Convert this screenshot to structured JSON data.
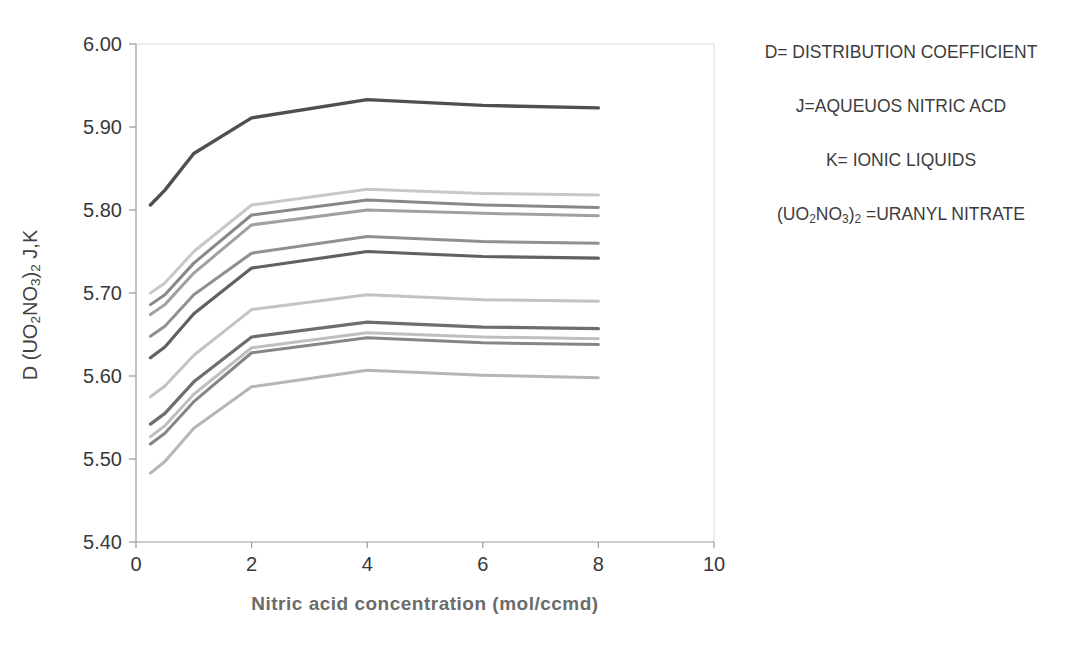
{
  "chart_data": {
    "type": "line",
    "title": "",
    "xlabel": "Nitric acid concentration (mol/ccmd)",
    "ylabel_plain": "D (UO2NO3)2 J,K",
    "ylabel_parts": [
      {
        "t": "D (UO"
      },
      {
        "t": "2",
        "sub": true
      },
      {
        "t": "NO"
      },
      {
        "t": "3",
        "sub": true
      },
      {
        "t": ")"
      },
      {
        "t": "2",
        "sub": true
      },
      {
        "t": " J,K"
      }
    ],
    "xlim": [
      0,
      10
    ],
    "ylim": [
      5.4,
      6.0
    ],
    "grid": false,
    "legend_position": "none",
    "x_tick_labels": [
      "0",
      "2",
      "4",
      "6",
      "8",
      "10"
    ],
    "x_tick_values": [
      0,
      2,
      4,
      6,
      8,
      10
    ],
    "y_tick_labels": [
      "6.00",
      "5.90",
      "5.80",
      "5.70",
      "5.60",
      "5.50",
      "5.40"
    ],
    "y_tick_values": [
      6.0,
      5.9,
      5.8,
      5.7,
      5.6,
      5.5,
      5.4
    ],
    "x": [
      0.25,
      0.5,
      1,
      2,
      4,
      6,
      8
    ],
    "series": [
      {
        "name": "line-01",
        "color": "#4f4f4f",
        "width": 3.4,
        "values": [
          5.806,
          5.824,
          5.868,
          5.911,
          5.933,
          5.926,
          5.923
        ]
      },
      {
        "name": "line-02",
        "color": "#c8c8c8",
        "width": 3.0,
        "values": [
          5.7,
          5.712,
          5.75,
          5.806,
          5.825,
          5.82,
          5.818
        ]
      },
      {
        "name": "line-03",
        "color": "#888888",
        "width": 3.0,
        "values": [
          5.686,
          5.698,
          5.736,
          5.794,
          5.812,
          5.806,
          5.803
        ]
      },
      {
        "name": "line-04",
        "color": "#a0a0a0",
        "width": 3.0,
        "values": [
          5.674,
          5.686,
          5.724,
          5.782,
          5.8,
          5.796,
          5.793
        ]
      },
      {
        "name": "line-05",
        "color": "#909090",
        "width": 3.0,
        "values": [
          5.648,
          5.66,
          5.698,
          5.748,
          5.768,
          5.762,
          5.76
        ]
      },
      {
        "name": "line-06",
        "color": "#616161",
        "width": 3.2,
        "values": [
          5.622,
          5.635,
          5.675,
          5.73,
          5.75,
          5.744,
          5.742
        ]
      },
      {
        "name": "line-07",
        "color": "#c3c3c3",
        "width": 3.0,
        "values": [
          5.575,
          5.588,
          5.625,
          5.68,
          5.698,
          5.692,
          5.69
        ]
      },
      {
        "name": "line-08",
        "color": "#6e6e6e",
        "width": 3.2,
        "values": [
          5.542,
          5.555,
          5.593,
          5.647,
          5.665,
          5.659,
          5.657
        ]
      },
      {
        "name": "line-09",
        "color": "#bfbfbf",
        "width": 3.0,
        "values": [
          5.527,
          5.54,
          5.578,
          5.634,
          5.652,
          5.647,
          5.645
        ]
      },
      {
        "name": "line-10",
        "color": "#868686",
        "width": 3.0,
        "values": [
          5.518,
          5.531,
          5.569,
          5.628,
          5.646,
          5.64,
          5.638
        ]
      },
      {
        "name": "line-11",
        "color": "#b6b6b6",
        "width": 3.0,
        "values": [
          5.483,
          5.497,
          5.537,
          5.587,
          5.607,
          5.601,
          5.598
        ]
      }
    ]
  },
  "annotations": {
    "line1": "D= DISTRIBUTION COEFFICIENT",
    "line2": "J=AQUEUOS NITRIC ACD",
    "line3": "K= IONIC LIQUIDS",
    "line4_parts": [
      {
        "t": "(UO"
      },
      {
        "t": "2",
        "sub": true
      },
      {
        "t": "NO"
      },
      {
        "t": "3",
        "sub": true
      },
      {
        "t": ")"
      },
      {
        "t": "2",
        "sub": true
      },
      {
        "t": " =URANYL NITRATE"
      }
    ]
  },
  "colors": {
    "axis_line": "#9a9a9a",
    "plot_border": "#dcdcdc",
    "tick_text": "#383838"
  }
}
